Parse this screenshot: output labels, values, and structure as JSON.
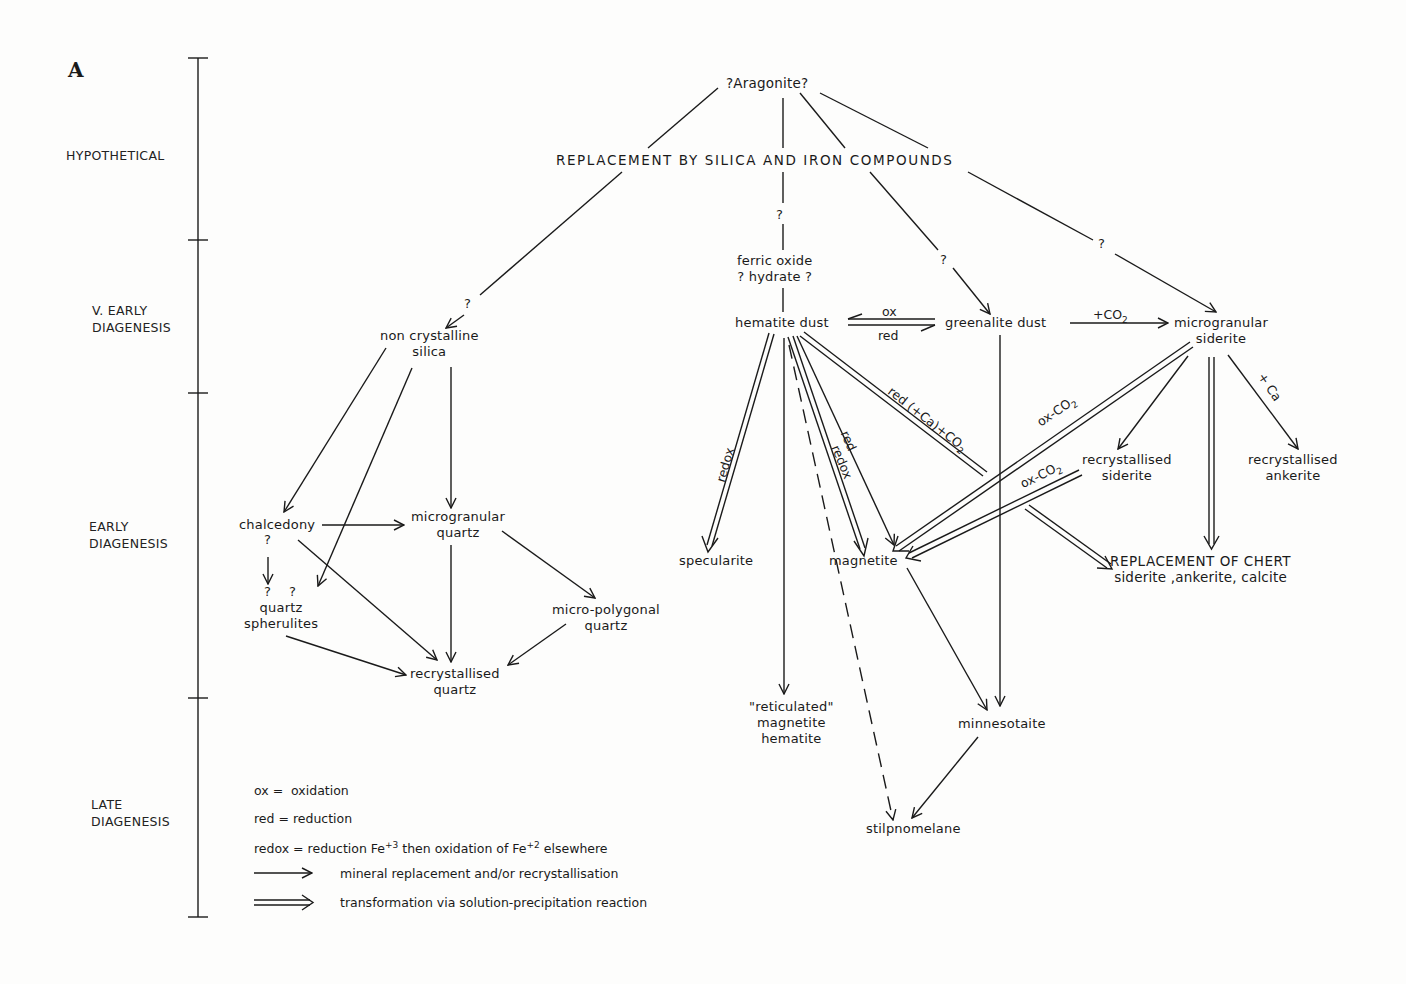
{
  "figure": {
    "panel_label": "A",
    "background_color": "#fdfdfc",
    "ink_color": "#1a1a1a"
  },
  "timeline": {
    "stages": [
      {
        "id": "hypothetical",
        "lines": [
          "HYPOTHETICAL",
          ""
        ]
      },
      {
        "id": "v-early",
        "lines": [
          "V. EARLY",
          "DIAGENESIS"
        ]
      },
      {
        "id": "early",
        "lines": [
          "EARLY",
          "DIAGENESIS"
        ]
      },
      {
        "id": "late",
        "lines": [
          "LATE",
          "DIAGENESIS"
        ]
      }
    ],
    "tick_y": [
      58,
      240,
      393,
      698,
      917
    ]
  },
  "nodes": {
    "aragonite": "?Aragonite?",
    "replacement_heading": "REPLACEMENT BY SILICA AND IRON COMPOUNDS",
    "ferric_oxide": [
      "ferric oxide",
      "? hydrate ?"
    ],
    "non_crystalline_silica": [
      "non crystalline",
      "silica"
    ],
    "hematite_dust": "hematite dust",
    "greenalite_dust": "greenalite dust",
    "microgranular_siderite": [
      "microgranular",
      "siderite"
    ],
    "chalcedony": "chalcedony",
    "microgranular_quartz": [
      "microgranular",
      "quartz"
    ],
    "quartz_spherulites": [
      "quartz",
      "spherulites"
    ],
    "micro_polygonal_quartz": [
      "micro-polygonal",
      "quartz"
    ],
    "recrystallised_quartz": [
      "recrystallised",
      "quartz"
    ],
    "specularite": "specularite",
    "magnetite": "magnetite",
    "recrystallised_siderite": [
      "recrystallised",
      "siderite"
    ],
    "recrystallised_ankerite": [
      "recrystallised",
      "ankerite"
    ],
    "replacement_of_chert": [
      "REPLACEMENT OF CHERT",
      "siderite ,ankerite, calcite"
    ],
    "reticulated": [
      "\"reticulated\"",
      "magnetite",
      "hematite"
    ],
    "minnesotaite": "minnesotaite",
    "stilpnomelane": "stilpnomelane"
  },
  "uncertainty_marks": {
    "q": "?"
  },
  "edge_labels": {
    "ox": "ox",
    "red": "red",
    "plus_co2": "+CO",
    "co2_sub": "2",
    "redox": "redox",
    "red_ca_co2": "red (+Ca)+CO",
    "ox_co2": "ox-CO",
    "plus_ca": "+ Ca"
  },
  "legend": {
    "items": [
      {
        "key": "ox =",
        "text": "oxidation"
      },
      {
        "key": "red =",
        "text": "reduction"
      },
      {
        "key": "redox =",
        "text": "reduction Fe",
        "sup1": "+3",
        "mid": " then oxidation of Fe",
        "sup2": "+2",
        "tail": " elsewhere"
      }
    ],
    "arrow_single": "mineral replacement and/or recrystallisation",
    "arrow_double": "transformation via solution-precipitation reaction"
  }
}
